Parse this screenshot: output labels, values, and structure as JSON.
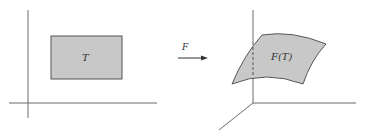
{
  "diagram": {
    "colors": {
      "background": "#ffffff",
      "axis": "#6b6b6b",
      "region_fill": "#c8c8c8",
      "region_stroke": "#555555",
      "arrow": "#333333",
      "text": "#333333"
    },
    "left_panel": {
      "region_label": "T",
      "axes": [
        "vertical-axis",
        "horizontal-axis"
      ]
    },
    "mapping": {
      "label": "F",
      "direction": "right"
    },
    "right_panel": {
      "surface_label": "F(T)",
      "axes": [
        "vertical-axis",
        "horizontal-axis",
        "depth-axis"
      ]
    }
  }
}
